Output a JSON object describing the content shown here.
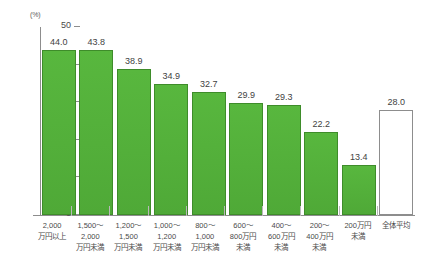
{
  "chart_data": {
    "type": "bar",
    "title": "",
    "subtitle": "",
    "xlabel": "",
    "ylabel": "",
    "yunit": "(%)",
    "ylim": [
      0,
      50
    ],
    "yticks": [
      0,
      10,
      20,
      30,
      40,
      50
    ],
    "ytick_labels": [
      "0",
      "10",
      "20",
      "30",
      "40",
      "50"
    ],
    "grid": false,
    "legend": "none",
    "categories": [
      "2,000\n万円以上",
      "1,500～\n2,000\n万円未満",
      "1,200～\n1,500\n万円未満",
      "1,000～\n1,200\n万円未満",
      "800～\n1,000\n万円未満",
      "600～\n800万円\n未満",
      "400～\n600万円\n未満",
      "200～\n400万円\n未満",
      "200万円\n未満",
      "全体平均"
    ],
    "category_lines": [
      [
        "2,000",
        "万円以上"
      ],
      [
        "1,500～",
        "2,000",
        "万円未満"
      ],
      [
        "1,200～",
        "1,500",
        "万円未満"
      ],
      [
        "1,000～",
        "1,200",
        "万円未満"
      ],
      [
        "800～",
        "1,000",
        "万円未満"
      ],
      [
        "600～",
        "800万円",
        "未満"
      ],
      [
        "400～",
        "600万円",
        "未満"
      ],
      [
        "200～",
        "400万円",
        "未満"
      ],
      [
        "200万円",
        "未満"
      ],
      [
        "全体平均"
      ]
    ],
    "values": [
      44.0,
      43.8,
      38.9,
      34.9,
      32.7,
      29.9,
      29.3,
      22.2,
      13.4,
      28.0
    ],
    "value_labels": [
      "44.0",
      "43.8",
      "38.9",
      "34.9",
      "32.7",
      "29.9",
      "29.3",
      "22.2",
      "13.4",
      "28.0"
    ],
    "series": [
      {
        "name": "割合",
        "values": [
          44.0,
          43.8,
          38.9,
          34.9,
          32.7,
          29.9,
          29.3,
          22.2,
          13.4,
          28.0
        ]
      }
    ],
    "bar_styles": [
      "filled",
      "filled",
      "filled",
      "filled",
      "filled",
      "filled",
      "filled",
      "filled",
      "filled",
      "outline"
    ],
    "colors": {
      "bar_fill": "#53b03a",
      "bar_border": "#3e8c2a",
      "average_fill": "#ffffff",
      "average_border": "#8d8d8d",
      "axis": "#8d8d8d",
      "text": "#4a4a4a",
      "background": "#ffffff"
    }
  }
}
